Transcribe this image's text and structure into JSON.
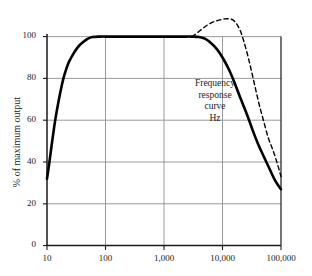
{
  "chart_data": {
    "type": "line",
    "title": "",
    "xlabel": "Hz",
    "ylabel": "% of maximum output",
    "xscale": "log",
    "xlim": [
      10,
      100000
    ],
    "ylim": [
      0,
      100
    ],
    "grid": true,
    "legend": "none",
    "x_ticks": [
      "10",
      "100",
      "1,000",
      "10,000",
      "100,000"
    ],
    "x_tick_values": [
      10,
      100,
      1000,
      10000,
      100000
    ],
    "y_ticks": [
      "100",
      "80",
      "60",
      "40",
      "20",
      "0"
    ],
    "y_tick_values": [
      100,
      80,
      60,
      40,
      20,
      0
    ],
    "annotations": [
      {
        "text": "Frequency",
        "line": 1
      },
      {
        "text": "response",
        "line": 2
      },
      {
        "text": "curve",
        "line": 3
      },
      {
        "text": "Hz",
        "line": 4
      }
    ],
    "series": [
      {
        "name": "Frequency response curve",
        "style": "solid",
        "color": "#000000",
        "width": 2.6,
        "points": [
          [
            10,
            32
          ],
          [
            11,
            40
          ],
          [
            12,
            48
          ],
          [
            13,
            55
          ],
          [
            14,
            61
          ],
          [
            16,
            70
          ],
          [
            18,
            77
          ],
          [
            20,
            82
          ],
          [
            23,
            87
          ],
          [
            26,
            90
          ],
          [
            30,
            93
          ],
          [
            35,
            95.5
          ],
          [
            42,
            97.5
          ],
          [
            50,
            99
          ],
          [
            60,
            99.8
          ],
          [
            80,
            100
          ],
          [
            120,
            100
          ],
          [
            300,
            100
          ],
          [
            1000,
            100
          ],
          [
            2000,
            100
          ],
          [
            3000,
            100
          ],
          [
            4000,
            99.8
          ],
          [
            5000,
            99
          ],
          [
            6000,
            97.5
          ],
          [
            8000,
            94
          ],
          [
            10000,
            90
          ],
          [
            13000,
            84
          ],
          [
            16000,
            78
          ],
          [
            20000,
            71
          ],
          [
            26000,
            63
          ],
          [
            32000,
            56
          ],
          [
            40000,
            49
          ],
          [
            50000,
            43
          ],
          [
            63000,
            37
          ],
          [
            80000,
            31
          ],
          [
            100000,
            27
          ]
        ]
      },
      {
        "name": "Extended response curve",
        "style": "dashed",
        "color": "#000000",
        "width": 1.4,
        "points": [
          [
            3000,
            100
          ],
          [
            3600,
            101.5
          ],
          [
            4400,
            103.5
          ],
          [
            5500,
            105.5
          ],
          [
            7000,
            107
          ],
          [
            9000,
            108
          ],
          [
            11000,
            108.5
          ],
          [
            13000,
            108.5
          ],
          [
            15000,
            108
          ],
          [
            17000,
            106.5
          ],
          [
            20000,
            103
          ],
          [
            23000,
            98
          ],
          [
            27000,
            91
          ],
          [
            31000,
            84
          ],
          [
            36000,
            76
          ],
          [
            42000,
            68
          ],
          [
            50000,
            60
          ],
          [
            60000,
            52
          ],
          [
            72000,
            46
          ],
          [
            85000,
            40
          ],
          [
            100000,
            33
          ]
        ]
      }
    ]
  },
  "axes": {
    "axis_color": "#1a1a1a",
    "grid_color": "#8e8e8e",
    "frame_color": "#1a1a1a"
  }
}
